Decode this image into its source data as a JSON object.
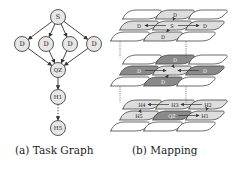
{
  "task_graph": {
    "caption": "(a) Task Graph",
    "nodes": [
      {
        "id": "s",
        "label": "S",
        "x": 58,
        "y": 17
      },
      {
        "id": "d1",
        "label": "D",
        "x": 22,
        "y": 44
      },
      {
        "id": "d2",
        "label": "D",
        "x": 46,
        "y": 44
      },
      {
        "id": "d3",
        "label": "D",
        "x": 70,
        "y": 44
      },
      {
        "id": "d4",
        "label": "D",
        "x": 94,
        "y": 44
      },
      {
        "id": "qz",
        "label": "QZ",
        "x": 58,
        "y": 70
      },
      {
        "id": "h1",
        "label": "H1",
        "x": 58,
        "y": 97
      },
      {
        "id": "h5",
        "label": "H5",
        "x": 58,
        "y": 128
      }
    ],
    "edges": [
      {
        "from": "s",
        "to": "d1"
      },
      {
        "from": "s",
        "to": "d2"
      },
      {
        "from": "s",
        "to": "d3"
      },
      {
        "from": "s",
        "to": "d4"
      },
      {
        "from": "d1",
        "to": "qz"
      },
      {
        "from": "d2",
        "to": "qz"
      },
      {
        "from": "d3",
        "to": "qz"
      },
      {
        "from": "d4",
        "to": "qz"
      },
      {
        "from": "qz",
        "to": "h1"
      },
      {
        "from": "h1",
        "to": "h5",
        "style": "dotted"
      }
    ]
  },
  "mapping": {
    "caption": "(b) Mapping",
    "layers": [
      {
        "name": "layer-1",
        "cells": [
          {
            "row": 0,
            "col": 0,
            "label": "",
            "fill": "none"
          },
          {
            "row": 0,
            "col": 1,
            "label": "D",
            "fill": "light"
          },
          {
            "row": 0,
            "col": 2,
            "label": "",
            "fill": "none"
          },
          {
            "row": 1,
            "col": 0,
            "label": "D",
            "fill": "light"
          },
          {
            "row": 1,
            "col": 1,
            "label": "S",
            "fill": "light"
          },
          {
            "row": 1,
            "col": 2,
            "label": "D",
            "fill": "light"
          },
          {
            "row": 2,
            "col": 0,
            "label": "",
            "fill": "none"
          },
          {
            "row": 2,
            "col": 1,
            "label": "D",
            "fill": "light"
          },
          {
            "row": 2,
            "col": 2,
            "label": "",
            "fill": "none"
          }
        ]
      },
      {
        "name": "layer-2",
        "cells": [
          {
            "row": 0,
            "col": 0,
            "label": "",
            "fill": "none"
          },
          {
            "row": 0,
            "col": 1,
            "label": "D",
            "fill": "dark"
          },
          {
            "row": 0,
            "col": 2,
            "label": "",
            "fill": "none"
          },
          {
            "row": 1,
            "col": 0,
            "label": "D",
            "fill": "dark"
          },
          {
            "row": 1,
            "col": 1,
            "label": "",
            "fill": "light"
          },
          {
            "row": 1,
            "col": 2,
            "label": "D",
            "fill": "dark"
          },
          {
            "row": 2,
            "col": 0,
            "label": "",
            "fill": "none"
          },
          {
            "row": 2,
            "col": 1,
            "label": "D",
            "fill": "dark"
          },
          {
            "row": 2,
            "col": 2,
            "label": "",
            "fill": "none"
          }
        ]
      },
      {
        "name": "layer-3",
        "cells": [
          {
            "row": 0,
            "col": 0,
            "label": "H4",
            "fill": "light"
          },
          {
            "row": 0,
            "col": 1,
            "label": "H3",
            "fill": "light"
          },
          {
            "row": 0,
            "col": 2,
            "label": "H2",
            "fill": "light"
          },
          {
            "row": 1,
            "col": 0,
            "label": "H5",
            "fill": "light"
          },
          {
            "row": 1,
            "col": 1,
            "label": "QZ",
            "fill": "dark"
          },
          {
            "row": 1,
            "col": 2,
            "label": "H1",
            "fill": "light"
          },
          {
            "row": 2,
            "col": 0,
            "label": "",
            "fill": "none"
          },
          {
            "row": 2,
            "col": 1,
            "label": "",
            "fill": "none"
          },
          {
            "row": 2,
            "col": 2,
            "label": "",
            "fill": "none"
          }
        ]
      }
    ]
  },
  "colors": {
    "stroke": "#444444",
    "node_fill": "#e6e6e6",
    "light_fill": "#dddddd",
    "dark_fill": "#8a8a8a",
    "text": "#222222"
  }
}
